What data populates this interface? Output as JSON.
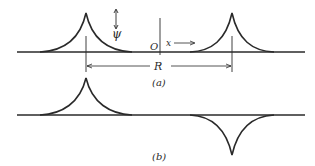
{
  "figure": {
    "panel_a": {
      "caption": "(a)",
      "psi_label": "ψ",
      "origin_label": "O",
      "x_label": "x",
      "distance_label": "R"
    },
    "panel_b": {
      "caption": "(b)"
    }
  },
  "colors": {
    "stroke": "#2a2a2a",
    "background": "#ffffff"
  }
}
